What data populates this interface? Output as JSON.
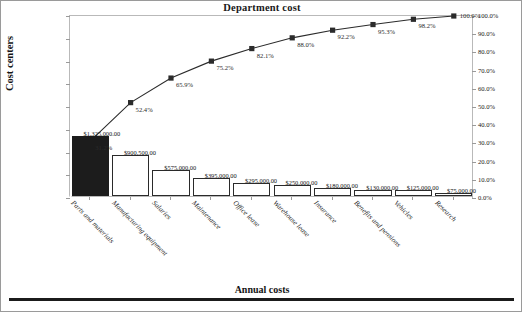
{
  "chart_data": {
    "type": "bar",
    "title": "Department cost",
    "xlabel": "Annual costs",
    "ylabel": "Cost centers",
    "y2label": "",
    "grid": false,
    "legend": "none",
    "ylim": [
      0,
      4000000
    ],
    "y2lim": [
      0,
      100
    ],
    "categories": [
      "Parts and materials",
      "Manufacturing equipment",
      "Salaries",
      "Maintenance",
      "Office lease",
      "Warehouse lease",
      "Insurance",
      "Benefits and pensions",
      "Vehicles",
      "Research"
    ],
    "series": [
      {
        "name": "Annual cost",
        "type": "bar",
        "values": [
          1325000,
          900500,
          575000,
          395000,
          295000,
          250000,
          180000,
          130000,
          125000,
          75000
        ],
        "labels": [
          "$1,325,000.00",
          "$900,500.00",
          "$575,000.00",
          "$395,000.00",
          "$295,000.00",
          "$250,000.00",
          "$180,000.00",
          "$130,000.00",
          "$125,000.00",
          "$75,000.00"
        ]
      },
      {
        "name": "Cumulative percentage",
        "type": "line",
        "values": [
          31.2,
          52.4,
          65.9,
          75.2,
          82.1,
          88.0,
          92.2,
          95.3,
          98.2,
          100.0
        ],
        "labels": [
          "31.2%",
          "52.4%",
          "65.9%",
          "75.2%",
          "82.1%",
          "88.0%",
          "92.2%",
          "95.3%",
          "98.2%",
          "100.0%"
        ]
      }
    ],
    "ytick_labels": [
      "$4,000,000.00",
      "$3,500,000.00",
      "$3,000,000.00",
      "$2,500,000.00",
      "$2,000,000.00",
      "$1,500,000.00",
      "$1,000,000.00",
      "$500,000.00",
      "$-"
    ],
    "ytick_values": [
      4000000,
      3500000,
      3000000,
      2500000,
      2000000,
      1500000,
      1000000,
      500000,
      0
    ],
    "y2tick_labels": [
      "100.0%",
      "90.0%",
      "80.0%",
      "70.0%",
      "60.0%",
      "50.0%",
      "40.0%",
      "30.0%",
      "20.0%",
      "10.0%",
      "0.0%"
    ],
    "y2tick_values": [
      100,
      90,
      80,
      70,
      60,
      50,
      40,
      30,
      20,
      10,
      0
    ],
    "colors": {
      "bar_fill": "#ffffff",
      "bar_outline": "#2a2a2a",
      "bar_first_fill": "#1c1c1c",
      "line": "#2b2b2b",
      "marker": "#2b2b2b",
      "axis": "#b9b9b9",
      "text": "#1a1a1a"
    }
  }
}
